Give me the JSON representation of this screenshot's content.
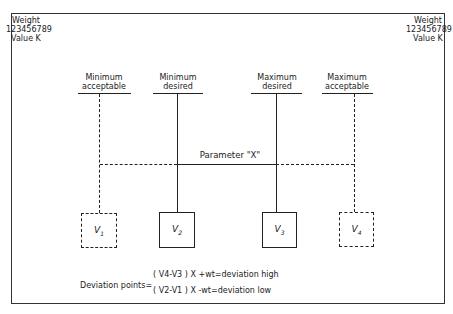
{
  "corner_labels": {
    "left": {
      "line1": "Weight",
      "line2": "123456789",
      "line3": "Value K"
    },
    "right": {
      "line1": "Weight",
      "line2": "123456789",
      "line3": "Value K"
    }
  },
  "columns": [
    {
      "label_line1": "Minimum",
      "label_line2": "acceptable",
      "value_name": "V",
      "value_sub": "1",
      "style": "dashed"
    },
    {
      "label_line1": "Minimum",
      "label_line2": "desired",
      "value_name": "V",
      "value_sub": "2",
      "style": "solid"
    },
    {
      "label_line1": "Maximum",
      "label_line2": "desired",
      "value_name": "V",
      "value_sub": "3",
      "style": "solid"
    },
    {
      "label_line1": "Maximum",
      "label_line2": "acceptable",
      "value_name": "V",
      "value_sub": "4",
      "style": "dashed"
    }
  ],
  "parameter_label": "Parameter \"X\"",
  "formula": {
    "prefix": "Deviation points=",
    "high": "( V4-V3 ) X +wt=deviation high",
    "low": "( V2-V1 ) X -wt=deviation low"
  }
}
